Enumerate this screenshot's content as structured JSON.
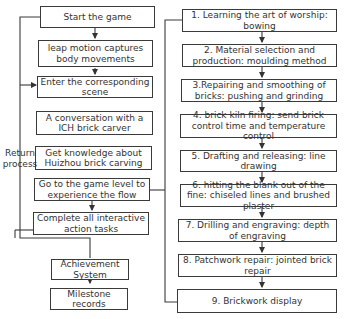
{
  "left_flow": [
    {
      "id": "start",
      "text": "Start the game"
    },
    {
      "id": "leap",
      "text": "leap motion captures body movements"
    },
    {
      "id": "enter",
      "text": "Enter the corresponding scene"
    },
    {
      "id": "conversation",
      "text": "A conversation with a ICH brick carver"
    },
    {
      "id": "knowledge",
      "text": "Get knowledge about Huizhou brick carving"
    },
    {
      "id": "game_level",
      "text": "Go to the game level to experience the flow"
    },
    {
      "id": "complete",
      "text": "Complete all interactive action tasks"
    },
    {
      "id": "achievement",
      "text": "Achievement System"
    },
    {
      "id": "milestone",
      "text": "Milestone records"
    }
  ],
  "return_label": "Return process",
  "right_flow": [
    {
      "text": "1. Learning the art of worship: bowing"
    },
    {
      "text": "2. Material selection and production: moulding method"
    },
    {
      "text": "3.Repairing and smoothing of bricks: pushing and grinding"
    },
    {
      "text": "4. brick kiln firing: send brick control time and temperature control"
    },
    {
      "text": "5. Drafting and releasing: line drawing"
    },
    {
      "text": "6. hitting the blank out of the fine: chiseled lines and brushed plaster"
    },
    {
      "text": "7. Drilling and engraving: depth of engraving"
    },
    {
      "text": "8. Patchwork repair: jointed brick repair"
    },
    {
      "text": "9. Brickwork display"
    }
  ]
}
